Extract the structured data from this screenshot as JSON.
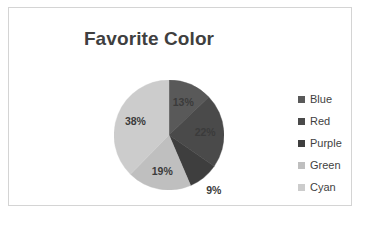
{
  "chart_data": {
    "type": "pie",
    "title": "Favorite Color",
    "categories": [
      "Blue",
      "Red",
      "Purple",
      "Green",
      "Cyan"
    ],
    "values": [
      13,
      22,
      9,
      19,
      38
    ],
    "value_labels": [
      "13%",
      "22%",
      "9%",
      "19%",
      "38%"
    ],
    "unit": "percent",
    "start_angle_deg": 0,
    "direction": "clockwise",
    "legend_position": "right",
    "grid": false,
    "xlabel": "",
    "ylabel": "",
    "slice_colors": [
      "#595959",
      "#4a4a4a",
      "#3e3e3e",
      "#bfbfbf",
      "#cccccc"
    ],
    "legend_swatch_colors": [
      "#595959",
      "#4a4a4a",
      "#3e3e3e",
      "#bfbfbf",
      "#cccccc"
    ],
    "label_placement": [
      "inside",
      "inside",
      "outside",
      "inside",
      "inside"
    ]
  },
  "frame": {
    "border_color": "#d4d4d4",
    "background": "#ffffff"
  },
  "title_color": "#3f3f3f",
  "label_color": "#3b3b3b"
}
